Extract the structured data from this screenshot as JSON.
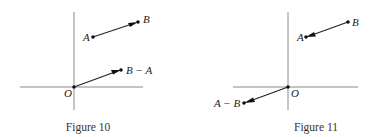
{
  "figures": [
    {
      "caption": "Figure 10",
      "labels": {
        "origin": "O",
        "a": "A",
        "b": "B",
        "diff": "B − A"
      }
    },
    {
      "caption": "Figure 11",
      "labels": {
        "origin": "O",
        "a": "A",
        "b": "B",
        "diff": "A − B"
      }
    }
  ],
  "colors": {
    "axis": "#8a8a8a",
    "vector": "#222222",
    "text": "#222222"
  }
}
